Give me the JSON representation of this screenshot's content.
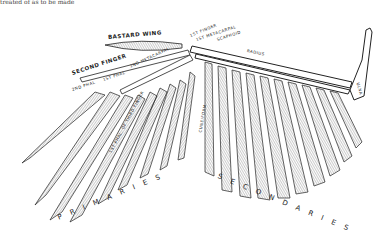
{
  "figure": {
    "top_caption_fragment": "treated of as to be made",
    "labels": {
      "bastard_wing": "BASTARD WING",
      "first_finger": "1ST FINGER",
      "metacarpal": "1ST METACARPAL",
      "scaphoid": "SCAPHOID",
      "radius": "RADIUS",
      "ulna": "ULNA",
      "second_finger": "SECOND FINGER",
      "second_phal": "2ND PHAL",
      "first_phal": "1ST PHAL",
      "third_phal": "3RD PHAL",
      "second_metacarpal": "2ND METACARPAL",
      "cuneiform": "CUNEIFORM",
      "third_finger": "1ST PHAL. OF THIRD FINGER",
      "primaries": "PRIMARIES",
      "secondaries": "SECONDARIES"
    }
  }
}
